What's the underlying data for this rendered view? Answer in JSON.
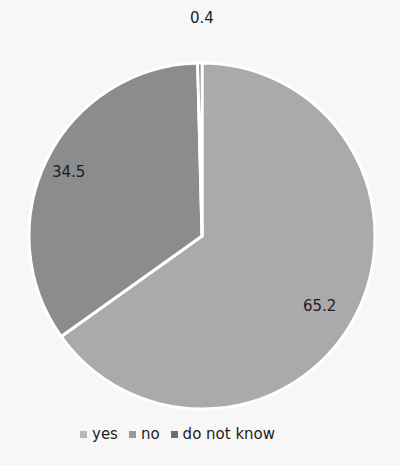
{
  "chart_data": {
    "type": "pie",
    "title": "",
    "categories": [
      "yes",
      "no",
      "do not know"
    ],
    "values": [
      65.2,
      34.5,
      0.4
    ],
    "colors": [
      "#aaaaaa",
      "#8c8c8c",
      "#6e6e6e"
    ],
    "start_angle_deg": 0,
    "direction": "clockwise",
    "data_labels": [
      "65.2",
      "34.5",
      "0.4"
    ],
    "legend": {
      "position": "bottom",
      "entries": [
        "yes",
        "no",
        "do not know"
      ]
    }
  },
  "labels": {
    "yes": "65.2",
    "no": "34.5",
    "dnk": "0.4"
  },
  "legend": {
    "items": [
      {
        "label": "yes",
        "color": "#aaaaaa"
      },
      {
        "label": "no",
        "color": "#8c8c8c"
      },
      {
        "label": "do not know",
        "color": "#6e6e6e"
      }
    ]
  }
}
